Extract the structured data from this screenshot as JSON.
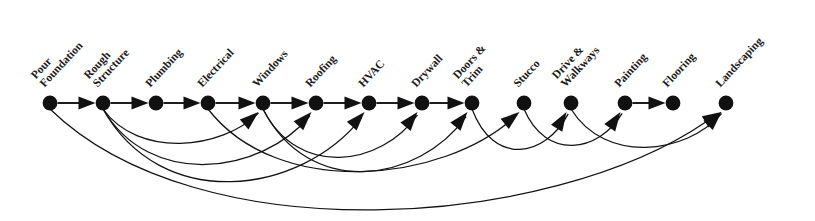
{
  "diagram": {
    "type": "directed-acyclic-graph",
    "node_color": "#111111",
    "edge_color": "#111111",
    "background_color": "#ffffff",
    "baseline_y": 103,
    "label_rotation_deg": -47,
    "nodes": [
      {
        "id": "pour-foundation",
        "label_lines": [
          "Pour",
          "Foundation"
        ],
        "x": 50,
        "y": 103
      },
      {
        "id": "rough-structure",
        "label_lines": [
          "Rough",
          "Structure"
        ],
        "x": 103,
        "y": 103
      },
      {
        "id": "plumbing",
        "label_lines": [
          "Plumbing"
        ],
        "x": 156,
        "y": 103
      },
      {
        "id": "electrical",
        "label_lines": [
          "Electrical"
        ],
        "x": 208,
        "y": 103
      },
      {
        "id": "windows",
        "label_lines": [
          "Windows"
        ],
        "x": 263,
        "y": 103
      },
      {
        "id": "roofing",
        "label_lines": [
          "Roofing"
        ],
        "x": 316,
        "y": 103
      },
      {
        "id": "hvac",
        "label_lines": [
          "HVAC"
        ],
        "x": 369,
        "y": 103
      },
      {
        "id": "drywall",
        "label_lines": [
          "Drywall"
        ],
        "x": 422,
        "y": 103
      },
      {
        "id": "doors-trim",
        "label_lines": [
          "Doors &",
          "Trim"
        ],
        "x": 472,
        "y": 103
      },
      {
        "id": "stucco",
        "label_lines": [
          "Stucco"
        ],
        "x": 524,
        "y": 103
      },
      {
        "id": "drive-walkways",
        "label_lines": [
          "Drive &",
          "Walkways"
        ],
        "x": 571,
        "y": 103
      },
      {
        "id": "painting",
        "label_lines": [
          "Painting"
        ],
        "x": 625,
        "y": 103
      },
      {
        "id": "flooring",
        "label_lines": [
          "Flooring"
        ],
        "x": 673,
        "y": 103
      },
      {
        "id": "landscaping",
        "label_lines": [
          "Landscaping"
        ],
        "x": 726,
        "y": 103
      }
    ],
    "edges_straight": [
      {
        "from": "pour-foundation",
        "to": "rough-structure"
      },
      {
        "from": "rough-structure",
        "to": "plumbing"
      },
      {
        "from": "plumbing",
        "to": "electrical"
      },
      {
        "from": "electrical",
        "to": "windows"
      },
      {
        "from": "windows",
        "to": "roofing"
      },
      {
        "from": "roofing",
        "to": "hvac"
      },
      {
        "from": "hvac",
        "to": "drywall"
      },
      {
        "from": "drywall",
        "to": "doors-trim"
      },
      {
        "from": "painting",
        "to": "flooring"
      }
    ],
    "edges_curved": [
      {
        "from": "rough-structure",
        "to": "windows",
        "depth": 34
      },
      {
        "from": "rough-structure",
        "to": "roofing",
        "depth": 55
      },
      {
        "from": "rough-structure",
        "to": "hvac",
        "depth": 72
      },
      {
        "from": "electrical",
        "to": "stucco",
        "depth": 62
      },
      {
        "from": "windows",
        "to": "drywall",
        "depth": 48
      },
      {
        "from": "windows",
        "to": "doors-trim",
        "depth": 62
      },
      {
        "from": "doors-trim",
        "to": "drive-walkways",
        "depth": 40
      },
      {
        "from": "stucco",
        "to": "painting",
        "depth": 36
      },
      {
        "from": "drive-walkways",
        "to": "landscaping",
        "depth": 38
      },
      {
        "from": "pour-foundation",
        "to": "landscaping",
        "depth": 100
      }
    ]
  }
}
